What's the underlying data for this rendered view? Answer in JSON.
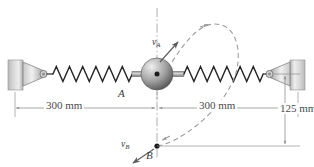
{
  "figure": {
    "labels": {
      "point_a": "A",
      "point_b": "B",
      "velocity_a_base": "v",
      "velocity_a_sub": "A",
      "velocity_b_base": "v",
      "velocity_b_sub": "B"
    },
    "dimensions": {
      "left_span": "300 mm",
      "right_span": "300 mm",
      "vertical_drop": "125 mm"
    },
    "colors": {
      "line": "#3a3a3a",
      "dim_line": "#8a8a8a",
      "dashed_path": "#9a9a9a",
      "wall_fill_light": "#e8e8e8",
      "wall_fill_dark": "#9d9d9d",
      "ball_highlight": "#e4e4e4",
      "ball_mid": "#9a9a9a",
      "ball_dark": "#4c4c4c",
      "background": "#ffffff"
    },
    "geometry": {
      "ball_center_x": 157,
      "ball_center_y": 74,
      "ball_radius": 16,
      "point_b_x": 157,
      "point_b_y": 146,
      "left_anchor_x": 22,
      "right_anchor_x": 290,
      "spring_turns_left": 13,
      "spring_turns_right": 13
    },
    "icon_names": {
      "left_wall": "wall-anchor-icon",
      "right_wall": "wall-anchor-icon",
      "ball": "collar-ball-icon",
      "spring_left": "spring-icon",
      "spring_right": "spring-icon",
      "centerline": "centerline-icon",
      "trajectory": "dashed-trajectory-icon",
      "arrow_va": "velocity-arrow-icon",
      "arrow_vb": "velocity-arrow-icon"
    }
  }
}
